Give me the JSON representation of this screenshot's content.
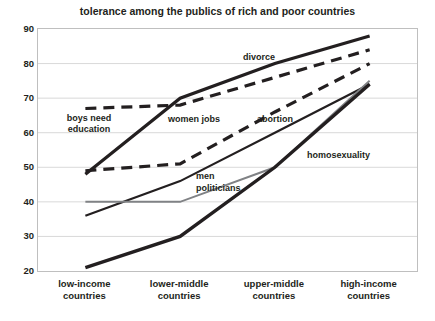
{
  "chart_data": {
    "type": "line",
    "title": "tolerance  among the publics of rich and poor countries",
    "xlabel": "",
    "ylabel": "",
    "ylim": [
      20,
      90
    ],
    "ytick_step": 10,
    "yticks": [
      90,
      80,
      70,
      60,
      50,
      40,
      30,
      20
    ],
    "grid": true,
    "legend": "inline-labels",
    "categories": [
      "low-income countries",
      "lower-middle countries",
      "upper-middle countries",
      "high-income countries"
    ],
    "category_lines": [
      [
        "low-income",
        "countries"
      ],
      [
        "lower-middle",
        "countries"
      ],
      [
        "upper-middle",
        "countries"
      ],
      [
        "high-income",
        "countries"
      ]
    ],
    "series": [
      {
        "name": "divorce",
        "label": "divorce",
        "style": "solid",
        "color": "#231f20",
        "width": 3.2,
        "values": [
          48,
          70,
          80,
          88
        ]
      },
      {
        "name": "boys need education",
        "label": "boys need education",
        "style": "dashed",
        "color": "#231f20",
        "width": 3.2,
        "values": [
          67,
          68,
          76,
          84
        ]
      },
      {
        "name": "women jobs",
        "label": "women jobs",
        "style": "dashed",
        "color": "#231f20",
        "width": 3.2,
        "values": [
          49,
          51,
          66,
          80
        ]
      },
      {
        "name": "abortion",
        "label": "abortion",
        "style": "solid",
        "color": "#231f20",
        "width": 2.2,
        "values": [
          36,
          46,
          60,
          74
        ]
      },
      {
        "name": "men politicians",
        "label": "men politicians",
        "style": "solid",
        "color": "#808285",
        "width": 2.0,
        "values": [
          40,
          40,
          50,
          75
        ]
      },
      {
        "name": "homosexuality",
        "label": "homosexuality",
        "style": "solid",
        "color": "#231f20",
        "width": 3.4,
        "values": [
          21,
          30,
          50,
          74
        ]
      }
    ],
    "annotations": [
      {
        "text": "divorce",
        "x_px": 243,
        "y_px": 52,
        "two_line": false
      },
      {
        "text": "boys need education",
        "x_px": 58,
        "y_px": 113,
        "two_line": true
      },
      {
        "text": "women jobs",
        "x_px": 168,
        "y_px": 114,
        "two_line": false
      },
      {
        "text": "abortion",
        "x_px": 257,
        "y_px": 114,
        "two_line": false
      },
      {
        "text": "homosexuality",
        "x_px": 307,
        "y_px": 150,
        "two_line": false
      },
      {
        "text": "men",
        "x_px": 196,
        "y_px": 171,
        "two_line": false
      },
      {
        "text": "politicians",
        "x_px": 196,
        "y_px": 183,
        "two_line": false
      }
    ],
    "colors": {
      "ink": "#231f20",
      "gray_series": "#808285",
      "gridline": "#d9d9d9",
      "frame": "#bfbfbf",
      "background": "#ffffff"
    }
  }
}
